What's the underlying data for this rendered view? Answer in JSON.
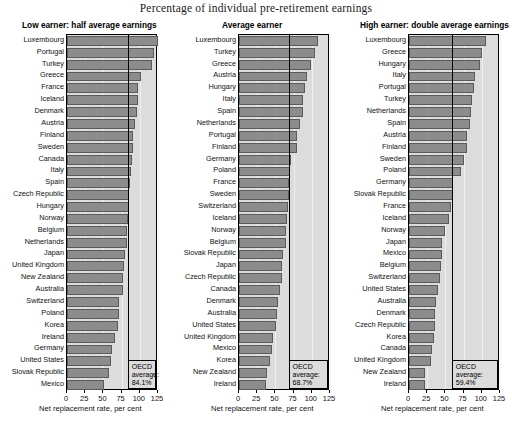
{
  "title": "Percentage of individual pre-retirement earnings",
  "axis": {
    "caption": "Net replacement rate, per cent",
    "ticks": [
      0,
      25,
      50,
      75,
      100,
      125
    ],
    "tick_labels": [
      "0",
      "25",
      "50",
      "75",
      "100",
      "125"
    ],
    "min": 0,
    "max": 125
  },
  "oecd_label_line1": "OECD",
  "oecd_label_line2": "average:",
  "colors": {
    "bar_fill": "#8c8c8c",
    "bar_edge": "#5a5a5a",
    "plot_bg": "#dcdcdc",
    "average_line": "#000000"
  },
  "chart_data": [
    {
      "type": "bar",
      "title": "Low earner: half average earnings",
      "xlabel": "Net replacement rate, per cent",
      "ylabel": "",
      "xlim": [
        0,
        125
      ],
      "grid": true,
      "orientation": "horizontal",
      "annotation": "OECD average: 84.1%",
      "average": 84.1,
      "average_text": "84.1%",
      "categories": [
        "Luxembourg",
        "Portugal",
        "Turkey",
        "Greece",
        "France",
        "Iceland",
        "Denmark",
        "Austria",
        "Finland",
        "Sweden",
        "Canada",
        "Italy",
        "Spain",
        "Czech Republic",
        "Hungary",
        "Norway",
        "Belgium",
        "Netherlands",
        "Japan",
        "United Kingdom",
        "New Zealand",
        "Australia",
        "Switzerland",
        "Poland",
        "Korea",
        "Ireland",
        "Germany",
        "United States",
        "Slovak Republic",
        "Mexico"
      ],
      "values": [
        125.0,
        119.0,
        117.0,
        101.0,
        98.0,
        97.0,
        96.0,
        93.0,
        91.0,
        90.0,
        89.0,
        88.0,
        86.0,
        85.0,
        85.0,
        84.0,
        83.0,
        83.0,
        80.0,
        78.0,
        77.0,
        77.0,
        72.0,
        71.0,
        70.0,
        66.0,
        62.0,
        61.0,
        58.0,
        51.0
      ]
    },
    {
      "type": "bar",
      "title": "Average earner",
      "xlabel": "Net replacement rate, per cent",
      "ylabel": "",
      "xlim": [
        0,
        125
      ],
      "grid": true,
      "orientation": "horizontal",
      "annotation": "OECD average: 68.7%",
      "average": 68.7,
      "average_text": "68.7%",
      "categories": [
        "Luxembourg",
        "Turkey",
        "Greece",
        "Austria",
        "Hungary",
        "Italy",
        "Spain",
        "Netherlands",
        "Portugal",
        "Finland",
        "Germany",
        "Poland",
        "France",
        "Sweden",
        "Switzerland",
        "Iceland",
        "Norway",
        "Belgium",
        "Slovak Republic",
        "Japan",
        "Czech Republic",
        "Canada",
        "Denmark",
        "Australia",
        "United States",
        "United Kingdom",
        "Mexico",
        "Korea",
        "New Zealand",
        "Ireland"
      ],
      "values": [
        109.0,
        104.0,
        99.0,
        93.0,
        90.0,
        88.0,
        88.0,
        84.0,
        80.0,
        79.0,
        72.0,
        70.0,
        69.0,
        68.0,
        67.0,
        66.0,
        65.0,
        64.0,
        61.0,
        59.0,
        59.0,
        57.0,
        54.0,
        52.0,
        51.0,
        47.0,
        45.0,
        43.0,
        38.0,
        37.0
      ]
    },
    {
      "type": "bar",
      "title": "High earner: double average earnings",
      "xlabel": "Net replacement rate, per cent",
      "ylabel": "",
      "xlim": [
        0,
        125
      ],
      "grid": true,
      "orientation": "horizontal",
      "annotation": "OECD average: 59.4%",
      "average": 59.4,
      "average_text": "59.4%",
      "categories": [
        "Luxembourg",
        "Greece",
        "Hungary",
        "Italy",
        "Portugal",
        "Turkey",
        "Netherlands",
        "Spain",
        "Austria",
        "Finland",
        "Sweden",
        "Poland",
        "Germany",
        "Slovak Republic",
        "France",
        "Iceland",
        "Norway",
        "Japan",
        "Mexico",
        "Belgium",
        "Switzerland",
        "United States",
        "Australia",
        "Denmark",
        "Czech Republic",
        "Korea",
        "Canada",
        "United Kingdom",
        "New Zealand",
        "Ireland"
      ],
      "values": [
        106.0,
        100.0,
        97.0,
        91.0,
        89.0,
        86.0,
        85.0,
        84.0,
        80.0,
        79.0,
        76.0,
        72.0,
        61.0,
        60.0,
        58.0,
        55.0,
        50.0,
        45.0,
        45.0,
        44.0,
        42.0,
        40.0,
        37.0,
        36.0,
        36.0,
        35.0,
        31.0,
        30.0,
        22.0,
        22.0
      ]
    }
  ]
}
